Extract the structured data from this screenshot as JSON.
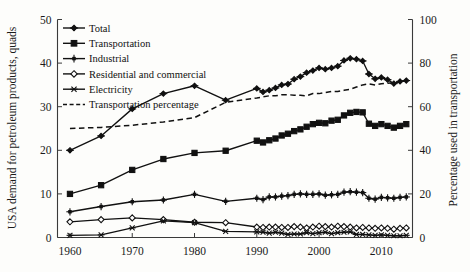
{
  "chart_data": {
    "type": "line",
    "title": "",
    "xlabel": "",
    "ylabel": "USA demand for petroleum products, quads",
    "y2label": "Percentage used in transportation",
    "xlim": [
      1958,
      2015
    ],
    "ylim": [
      0,
      50
    ],
    "y2lim": [
      0,
      100
    ],
    "xticks": [
      1960,
      1970,
      1980,
      1990,
      2000,
      2010
    ],
    "yticks": [
      0,
      10,
      20,
      30,
      40,
      50
    ],
    "y2ticks": [
      0,
      20,
      40,
      60,
      80,
      100
    ],
    "grid": false,
    "legend_position": "top-left",
    "x": [
      1960,
      1965,
      1970,
      1975,
      1980,
      1985,
      1990,
      1991,
      1992,
      1993,
      1994,
      1995,
      1996,
      1997,
      1998,
      1999,
      2000,
      2001,
      2002,
      2003,
      2004,
      2005,
      2006,
      2007,
      2008,
      2009,
      2010,
      2011,
      2012,
      2013,
      2014
    ],
    "series": [
      {
        "name": "Total",
        "axis": "left",
        "marker": "plus-diamond",
        "linestyle": "solid",
        "color": "#111111",
        "values": [
          20.0,
          23.3,
          29.5,
          33.0,
          34.8,
          31.5,
          34.2,
          33.4,
          33.8,
          34.3,
          35.0,
          35.2,
          36.3,
          36.9,
          37.8,
          38.3,
          38.9,
          38.6,
          38.9,
          39.3,
          40.6,
          41.1,
          40.9,
          40.5,
          37.5,
          36.4,
          36.7,
          36.2,
          35.3,
          35.8,
          36.0
        ]
      },
      {
        "name": "Transportation",
        "axis": "left",
        "marker": "filled-square",
        "linestyle": "solid",
        "color": "#111111",
        "values": [
          10.0,
          12.0,
          15.5,
          18.0,
          19.4,
          19.9,
          22.2,
          21.8,
          22.3,
          22.7,
          23.4,
          23.8,
          24.4,
          24.8,
          25.4,
          26.0,
          26.3,
          26.2,
          26.8,
          27.0,
          28.0,
          28.6,
          28.8,
          28.7,
          26.1,
          25.6,
          26.0,
          25.6,
          25.2,
          25.6,
          26.0
        ]
      },
      {
        "name": "Industrial",
        "axis": "left",
        "marker": "plus-star",
        "linestyle": "solid",
        "color": "#111111",
        "values": [
          5.9,
          7.1,
          8.2,
          8.6,
          9.9,
          8.3,
          9.0,
          8.7,
          9.3,
          9.3,
          9.5,
          9.6,
          9.9,
          10.0,
          9.9,
          9.9,
          10.0,
          9.7,
          9.8,
          9.9,
          10.4,
          10.5,
          10.4,
          10.3,
          9.0,
          8.8,
          9.2,
          9.1,
          9.0,
          9.2,
          9.3
        ]
      },
      {
        "name": "Residential and commercial",
        "axis": "left",
        "marker": "open-diamond",
        "linestyle": "solid",
        "color": "#111111",
        "values": [
          3.6,
          4.1,
          4.5,
          4.1,
          3.5,
          3.4,
          2.4,
          2.3,
          2.4,
          2.4,
          2.3,
          2.3,
          2.5,
          2.4,
          2.2,
          2.4,
          2.6,
          2.5,
          2.4,
          2.6,
          2.5,
          2.4,
          2.2,
          2.3,
          2.2,
          2.1,
          2.2,
          2.1,
          1.9,
          2.1,
          2.2
        ]
      },
      {
        "name": "Electricity",
        "axis": "left",
        "marker": "asterisk",
        "linestyle": "solid",
        "color": "#111111",
        "values": [
          0.5,
          0.6,
          2.2,
          3.8,
          3.4,
          1.4,
          1.3,
          1.2,
          1.0,
          1.2,
          1.0,
          0.7,
          0.8,
          0.8,
          1.1,
          0.9,
          1.1,
          1.2,
          0.9,
          1.1,
          1.2,
          1.3,
          0.7,
          0.7,
          0.6,
          0.5,
          0.6,
          0.5,
          0.4,
          0.4,
          0.5
        ]
      },
      {
        "name": "Transportation percentage",
        "axis": "right",
        "marker": "none",
        "linestyle": "dashed",
        "color": "#111111",
        "values": [
          50.0,
          50.5,
          51.5,
          53.0,
          55.0,
          62.0,
          64.0,
          64.5,
          65.0,
          65.0,
          65.5,
          65.5,
          65.3,
          65.2,
          65.0,
          66.0,
          66.0,
          66.5,
          67.0,
          67.0,
          67.5,
          68.0,
          69.0,
          70.0,
          70.5,
          70.0,
          70.5,
          70.8,
          71.0,
          71.5,
          71.8
        ]
      }
    ],
    "legend": [
      {
        "label": "Total",
        "marker": "plus-diamond",
        "linestyle": "solid"
      },
      {
        "label": "Transportation",
        "marker": "filled-square",
        "linestyle": "solid"
      },
      {
        "label": "Industrial",
        "marker": "plus-star",
        "linestyle": "solid"
      },
      {
        "label": "Residential and commercial",
        "marker": "open-diamond",
        "linestyle": "solid"
      },
      {
        "label": "Electricity",
        "marker": "asterisk",
        "linestyle": "solid"
      },
      {
        "label": "Transportation percentage",
        "marker": "none",
        "linestyle": "dashed"
      }
    ]
  },
  "axes": {
    "left_title": "USA demand for petroleum products, quads",
    "right_title": "Percentage used in transportation",
    "left_ticks": [
      "0",
      "10",
      "20",
      "30",
      "40",
      "50"
    ],
    "right_ticks": [
      "0",
      "20",
      "40",
      "60",
      "80",
      "100"
    ],
    "x_ticks": [
      "1960",
      "1970",
      "1980",
      "1990",
      "2000",
      "2010"
    ]
  },
  "colors": {
    "ink": "#111111",
    "axis": "#3a3a3a",
    "background": "#fdfdfb"
  }
}
